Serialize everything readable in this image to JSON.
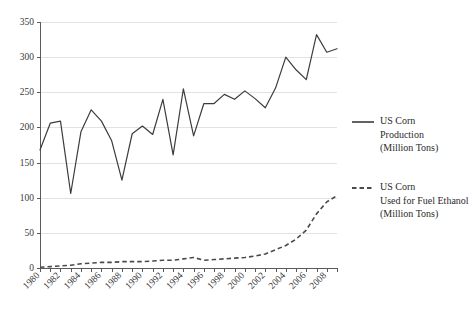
{
  "chart_data": {
    "type": "line",
    "title": "",
    "subtitle": "",
    "xlabel": "",
    "ylabel": "",
    "grid": true,
    "legend_position": "right",
    "xlim": [
      1980,
      2009
    ],
    "ylim": [
      0,
      350
    ],
    "ytick_values": [
      0,
      50,
      100,
      150,
      200,
      250,
      300,
      350
    ],
    "ytick_labels": [
      "0",
      "50",
      "100",
      "150",
      "200",
      "250",
      "300",
      "350"
    ],
    "xtick_values": [
      1980,
      1982,
      1984,
      1986,
      1988,
      1990,
      1992,
      1994,
      1996,
      1998,
      2000,
      2002,
      2004,
      2006,
      2008
    ],
    "xtick_labels": [
      "1980",
      "1982",
      "1984",
      "1986",
      "1988",
      "1990",
      "1992",
      "1994",
      "1996",
      "1998",
      "2000",
      "2002",
      "2004",
      "2006",
      "2008"
    ],
    "x": [
      1980,
      1981,
      1982,
      1983,
      1984,
      1985,
      1986,
      1987,
      1988,
      1989,
      1990,
      1991,
      1992,
      1993,
      1994,
      1995,
      1996,
      1997,
      1998,
      1999,
      2000,
      2001,
      2002,
      2003,
      2004,
      2005,
      2006,
      2007,
      2008,
      2009
    ],
    "series": [
      {
        "name": "US Corn Production (Million Tons)",
        "style": "solid",
        "color": "#3c3c3c",
        "values": [
          168,
          206,
          209,
          106,
          194,
          225,
          209,
          181,
          125,
          191,
          202,
          190,
          240,
          161,
          255,
          188,
          234,
          234,
          247,
          240,
          252,
          241,
          228,
          256,
          300,
          282,
          268,
          332,
          307,
          312
        ]
      },
      {
        "name": "US Corn Used for Fuel Ethanol (Million Tons)",
        "style": "dashed",
        "color": "#4a4a4a",
        "values": [
          1,
          2,
          3,
          4,
          6,
          7,
          8,
          8,
          9,
          9,
          9,
          10,
          11,
          11,
          13,
          15,
          11,
          12,
          13,
          14,
          15,
          17,
          20,
          26,
          32,
          41,
          54,
          77,
          94,
          103
        ]
      }
    ],
    "legend": [
      {
        "style": "solid",
        "lines": [
          "US Corn",
          "Production",
          "(Million Tons)"
        ]
      },
      {
        "style": "dashed",
        "lines": [
          "US Corn",
          "Used for Fuel Ethanol",
          "(Million Tons)"
        ]
      }
    ]
  }
}
